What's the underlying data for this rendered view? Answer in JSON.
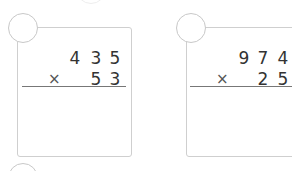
{
  "problems": [
    {
      "number_label": "",
      "multiplicand": [
        "4",
        "3",
        "5"
      ],
      "multiplier": [
        "5",
        "3"
      ],
      "operator": "×"
    },
    {
      "number_label": "",
      "multiplicand": [
        "9",
        "7",
        "4"
      ],
      "multiplier": [
        "2",
        "5"
      ],
      "operator": "×"
    }
  ]
}
